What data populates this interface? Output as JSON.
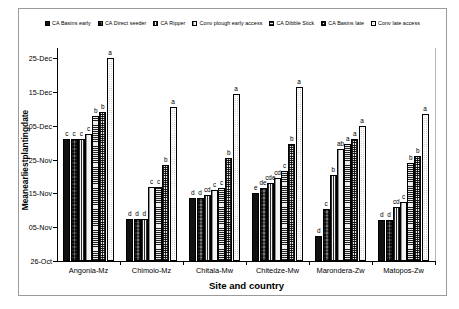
{
  "chart_data": {
    "type": "bar",
    "title": "",
    "xlabel": "Site and country",
    "ylabel": "Meanearliestplantingdate",
    "categories": [
      "Angonia-Mz",
      "Chimoio-Mz",
      "Chitala-Mw",
      "Chitedze-Mw",
      "Marondera-Zw",
      "Matopos-Zw"
    ],
    "ytick_labels": [
      "25-Dec",
      "15-Dec",
      "05-Dec",
      "25-Nov",
      "15-Nov",
      "05-Nov",
      "26-Oct"
    ],
    "ytick_values": [
      60,
      50,
      40,
      30,
      20,
      10,
      0
    ],
    "ylim": [
      0,
      63
    ],
    "ylim_note": "days after 26-Oct baseline",
    "grid": false,
    "legend_position": "top",
    "series": [
      {
        "name": "CA Basins early",
        "pattern": "solid-black",
        "values": [
          36.0,
          12.5,
          18.5,
          20.0,
          7.5,
          12.0
        ],
        "letters": [
          "c",
          "d",
          "d",
          "e",
          "d",
          "d"
        ]
      },
      {
        "name": "CA Direct seeder",
        "pattern": "dark-check",
        "values": [
          36.0,
          12.5,
          18.5,
          21.5,
          15.5,
          12.0
        ],
        "letters": [
          "c",
          "d",
          "d",
          "de",
          "c",
          "d"
        ]
      },
      {
        "name": "CA Ripper",
        "pattern": "vertical-stripe",
        "values": [
          36.0,
          12.5,
          19.5,
          23.0,
          25.5,
          16.0
        ],
        "letters": [
          "c",
          "d",
          "cd",
          "cde",
          "b",
          "cd"
        ]
      },
      {
        "name": "Conv plough early access",
        "pattern": "light-vertical-line",
        "values": [
          37.5,
          22.0,
          21.0,
          24.5,
          33.0,
          17.5
        ],
        "letters": [
          "c",
          "c",
          "c",
          "cd",
          "ab",
          "c"
        ]
      },
      {
        "name": "CA Dibble Stick",
        "pattern": "horizontal-line",
        "values": [
          43.0,
          22.0,
          21.5,
          26.5,
          34.5,
          29.0
        ],
        "letters": [
          "b",
          "c",
          "c",
          "c",
          "a",
          "b"
        ]
      },
      {
        "name": "CA Basins late",
        "pattern": "check-dot",
        "values": [
          44.0,
          28.5,
          30.5,
          34.5,
          36.0,
          31.0
        ],
        "letters": [
          "b",
          "b",
          "b",
          "b",
          "a",
          "b"
        ]
      },
      {
        "name": "Conv late access",
        "pattern": "white-dot",
        "values": [
          60.0,
          45.5,
          49.5,
          51.5,
          40.0,
          43.5
        ],
        "letters": [
          "a",
          "a",
          "a",
          "a",
          "a",
          "a"
        ]
      }
    ]
  },
  "axis": {
    "y_title": "Meanearliestplantingdate",
    "x_title": "Site and country"
  }
}
